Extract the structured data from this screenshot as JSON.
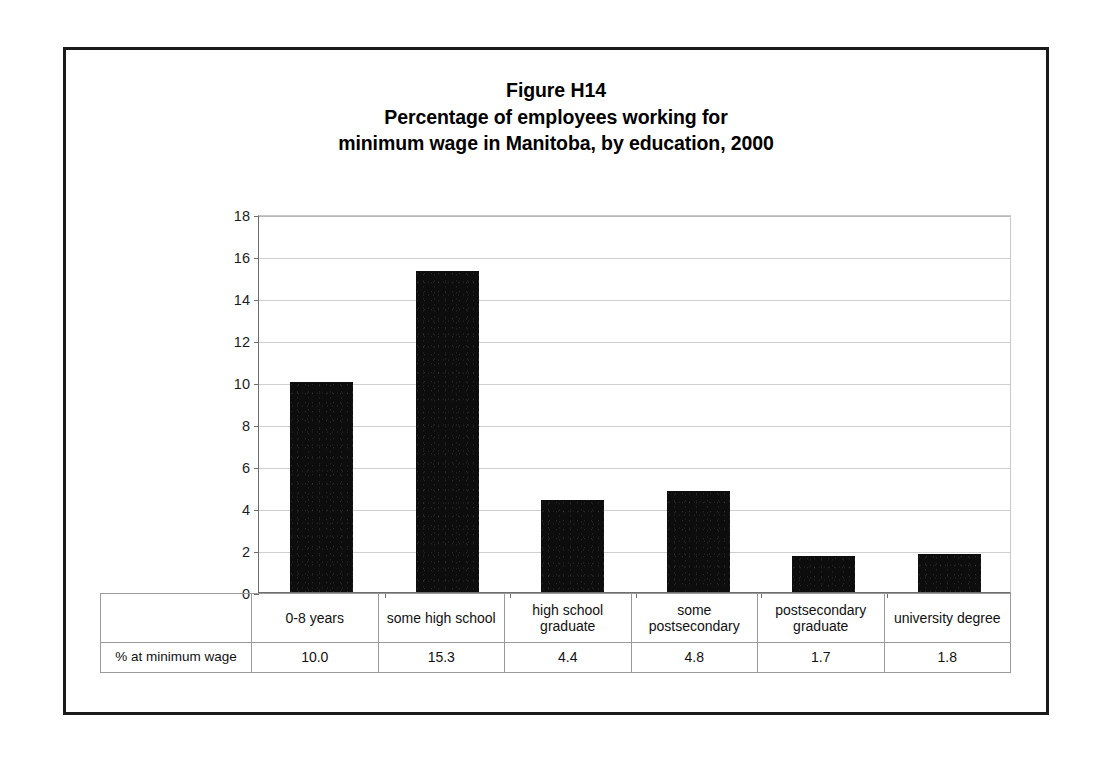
{
  "figure": {
    "title_lines": [
      "Figure H14",
      "Percentage of employees working for",
      "minimum wage in Manitoba, by education, 2000"
    ]
  },
  "table": {
    "key_label": "% at minimum wage"
  },
  "chart_data": {
    "type": "bar",
    "title": "Figure H14 Percentage of employees working for minimum wage in Manitoba, by education, 2000",
    "xlabel": "",
    "ylabel": "",
    "categories": [
      "0-8 years",
      "some high school",
      "high school graduate",
      "some postsecondary",
      "postsecondary graduate",
      "university degree"
    ],
    "category_label_lines": [
      [
        "0-8 years"
      ],
      [
        "some high school"
      ],
      [
        "high school",
        "graduate"
      ],
      [
        "some",
        "postsecondary"
      ],
      [
        "postsecondary",
        "graduate"
      ],
      [
        "university degree"
      ]
    ],
    "values": [
      10.0,
      15.3,
      4.4,
      4.8,
      1.7,
      1.8
    ],
    "value_labels": [
      "10.0",
      "15.3",
      "4.4",
      "4.8",
      "1.7",
      "1.8"
    ],
    "series_name": "% at minimum wage",
    "ylim": [
      0,
      18
    ],
    "yticks": [
      0,
      2,
      4,
      6,
      8,
      10,
      12,
      14,
      16,
      18
    ],
    "ytick_labels": [
      "0",
      "2",
      "4",
      "6",
      "8",
      "10",
      "12",
      "14",
      "16",
      "18"
    ],
    "grid": true,
    "legend": false,
    "bar_color": "#0d0d0d",
    "gridline_color": "#cfcfcf",
    "axis_color": "#6e6e6e"
  }
}
